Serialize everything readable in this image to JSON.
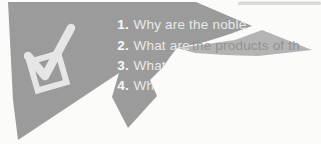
{
  "colors": {
    "paper_gray": "#9b9b9b",
    "torn_strip_gray": "#b4b4b4",
    "icon_light": "#e6e6e6",
    "number_white": "#f9f9f9",
    "text_white": "#e9e9e9",
    "torn_text_dark": "#8d8d8d",
    "artifact_gray": "#d9d9d9"
  },
  "icon": {
    "name": "checked-checkbox"
  },
  "questions": [
    {
      "num": "1.",
      "text": "Why are the noble g"
    },
    {
      "num": "2.",
      "text_solid": "What are ",
      "text_torn": "the products of th"
    },
    {
      "num": "3.",
      "text": "What i"
    },
    {
      "num": "4.",
      "text": "Wha"
    }
  ]
}
